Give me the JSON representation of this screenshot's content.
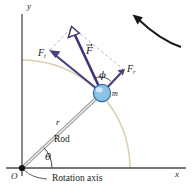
{
  "figure": {
    "canvas": {
      "width": 196,
      "height": 191
    },
    "colors": {
      "axis": "#3a3a3a",
      "vector": "#3d3573",
      "vector_light": "#6f67a8",
      "rod": "#b0b0b0",
      "arc": "#d8c9a8",
      "dashed": "#b9b4ca",
      "ball_fill": "#7fb8e0",
      "ball_edge": "#2e6fa3",
      "text": "#1a1a1a",
      "rotation_arrow": "#1a1a1a"
    }
  },
  "labels": {
    "y_axis": "y",
    "x_axis": "x",
    "origin": "O",
    "rotation_axis": "Rotation axis",
    "rod": "Rod",
    "radius": "r",
    "theta": "θ",
    "phi": "ϕ",
    "mass": "m",
    "force_total_symbol": "F",
    "force_tangential_symbol": "F",
    "force_tangential_subscript": "t",
    "force_radial_symbol": "F",
    "force_radial_subscript": "r"
  },
  "geometry": {
    "origin": {
      "x": 22,
      "y": 168
    },
    "mass_point": {
      "x": 102,
      "y": 93
    },
    "theta_degrees": 43,
    "y_axis": {
      "x": 22,
      "y_top": 14,
      "y_bottom": 176
    },
    "x_axis": {
      "y": 168,
      "x_left": 6,
      "x_right": 186
    },
    "force_tip": {
      "x": 72,
      "y": 27
    },
    "force_tangential_tip": {
      "x": 50,
      "y": 50
    },
    "force_radial_tip": {
      "x": 124,
      "y": 70
    },
    "arc_radius": 108,
    "rotation_arrow": {
      "start": {
        "x": 182,
        "y": 48
      },
      "end": {
        "x": 133,
        "y": 17
      }
    }
  },
  "annotations": {
    "leader_from": {
      "x": 48,
      "y": 178
    },
    "leader_to": {
      "x": 28,
      "y": 170
    }
  }
}
